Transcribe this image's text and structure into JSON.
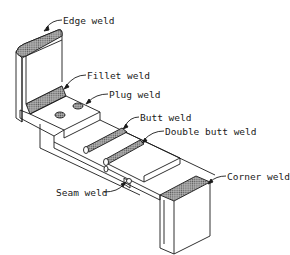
{
  "diagram": {
    "type": "isometric weld types illustration",
    "labels": {
      "edge_weld": "Edge weld",
      "fillet_weld": "Fillet weld",
      "plug_weld": "Plug weld",
      "butt_weld": "Butt weld",
      "double_butt_weld": "Double butt weld",
      "seam_weld": "Seam weld",
      "corner_weld": "Corner weld"
    },
    "colors": {
      "line": "#1a1a1a",
      "hatch": "#8a8a8a",
      "background": "#ffffff"
    }
  }
}
